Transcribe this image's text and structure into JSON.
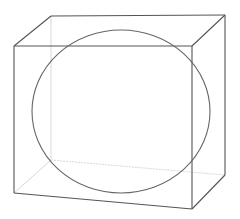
{
  "diagram": {
    "colors": {
      "background": "#ffffff",
      "visible_edge": "#555555",
      "hidden_edge": "#d8d8d8",
      "circle": "#666666"
    },
    "box": {
      "front_face": {
        "top_left": [
          14,
          46
        ],
        "top_right": [
          192,
          46
        ],
        "bottom_right": [
          192,
          209
        ],
        "bottom_left": [
          14,
          193
        ]
      },
      "back_face": {
        "top_left": [
          51,
          16
        ],
        "top_right": [
          225,
          15
        ],
        "bottom_right": [
          225,
          175
        ],
        "bottom_left": [
          51,
          160
        ]
      }
    },
    "sphere": {
      "cx": 121,
      "cy": 111.5,
      "rx": 89,
      "ry": 81.5
    }
  }
}
